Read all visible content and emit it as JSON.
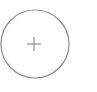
{
  "add_button": {
    "icon": "plus-icon",
    "stroke_color": "#8a8a8a",
    "plus_color": "#777777"
  }
}
